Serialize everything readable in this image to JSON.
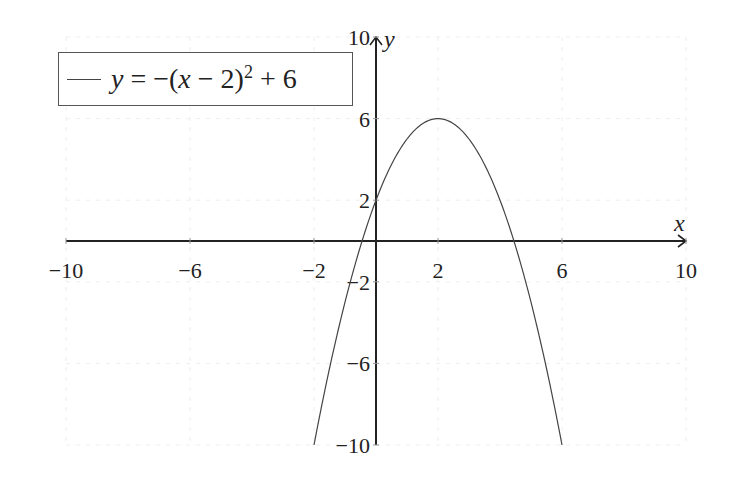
{
  "chart_data": {
    "type": "line",
    "title": "",
    "xlabel": "x",
    "ylabel": "y",
    "xlim": [
      -10,
      10
    ],
    "ylim": [
      -10,
      10
    ],
    "grid": true,
    "legend_position": "upper left",
    "x_ticks": [
      -10,
      -6,
      -2,
      2,
      6,
      10
    ],
    "y_ticks": [
      -10,
      -6,
      -2,
      2,
      6,
      10
    ],
    "x_tick_labels": [
      "−10",
      "−6",
      "−2",
      "2",
      "6",
      "10"
    ],
    "y_tick_labels": [
      "−10",
      "−6",
      "−2",
      "2",
      "6",
      "10"
    ],
    "series": [
      {
        "name": "y = −(x−2)^2 + 6",
        "expression": "-(x-2)^2+6",
        "domain": [
          -2,
          6
        ],
        "x": [
          -2,
          -1,
          0,
          1,
          2,
          3,
          4,
          5,
          6
        ],
        "values": [
          -10,
          -3,
          2,
          5,
          6,
          5,
          2,
          -3,
          -10
        ],
        "color": "#444444"
      }
    ]
  },
  "legend": {
    "prefix": "y = −(",
    "var": "x",
    "mid": " − 2)",
    "exp": "2",
    "suffix": " + 6"
  }
}
